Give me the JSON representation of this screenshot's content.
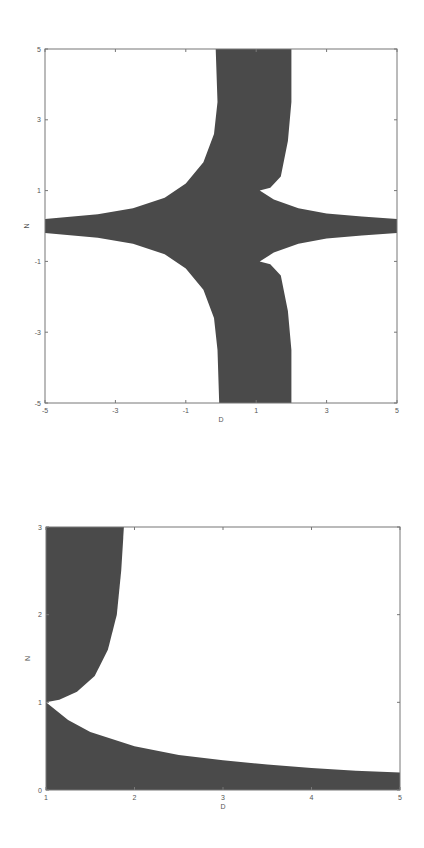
{
  "colors": {
    "fill": "#4a4a4a",
    "frame": "#777777",
    "background": "#ffffff"
  },
  "chart_data": [
    {
      "type": "area",
      "title": "",
      "xlabel": "D",
      "ylabel": "N",
      "xlim": [
        -5,
        5
      ],
      "ylim": [
        -5,
        5
      ],
      "xticks": [
        -5,
        -3,
        -1,
        1,
        3,
        5
      ],
      "yticks": [
        -5,
        -3,
        -1,
        1,
        3,
        5
      ],
      "grid": false,
      "frame_px": {
        "left": 45,
        "top": 49,
        "right": 397,
        "bottom": 403
      },
      "description": "Shaded region: horizontal band around N=0 widening toward D≈1, and vertical band D≈0..2 for |N|>1, with cusps at (1, ±1)",
      "regions": [
        {
          "name": "upper-vertical-band",
          "points": [
            [
              -0.15,
              5
            ],
            [
              -0.1,
              3.5
            ],
            [
              -0.2,
              2.6
            ],
            [
              -0.5,
              1.8
            ],
            [
              -1.0,
              1.2
            ],
            [
              -1.6,
              0.8
            ],
            [
              -2.5,
              0.5
            ],
            [
              -3.5,
              0.33
            ],
            [
              -5,
              0.2
            ],
            [
              -5,
              -0.2
            ],
            [
              -3.5,
              -0.33
            ],
            [
              -2.5,
              -0.5
            ],
            [
              -1.6,
              -0.8
            ],
            [
              -1.0,
              -1.2
            ],
            [
              -0.5,
              -1.8
            ],
            [
              -0.2,
              -2.6
            ],
            [
              -0.1,
              -3.5
            ],
            [
              -0.05,
              -5
            ],
            [
              2.0,
              -5
            ],
            [
              2.0,
              -3.5
            ],
            [
              1.9,
              -2.4
            ],
            [
              1.7,
              -1.4
            ],
            [
              1.4,
              -1.08
            ],
            [
              1.1,
              -1.0
            ],
            [
              1.5,
              -0.75
            ],
            [
              2.2,
              -0.5
            ],
            [
              3.0,
              -0.35
            ],
            [
              4.0,
              -0.27
            ],
            [
              5,
              -0.2
            ],
            [
              5,
              0.2
            ],
            [
              4.0,
              0.27
            ],
            [
              3.0,
              0.35
            ],
            [
              2.2,
              0.5
            ],
            [
              1.5,
              0.75
            ],
            [
              1.1,
              1.0
            ],
            [
              1.4,
              1.08
            ],
            [
              1.7,
              1.4
            ],
            [
              1.9,
              2.4
            ],
            [
              2.0,
              3.5
            ],
            [
              2.0,
              5
            ]
          ]
        }
      ]
    },
    {
      "type": "area",
      "title": "",
      "xlabel": "D",
      "ylabel": "N",
      "xlim": [
        1,
        5
      ],
      "ylim": [
        0,
        3
      ],
      "xticks": [
        1,
        2,
        3,
        4,
        5
      ],
      "yticks": [
        0,
        1,
        2,
        3
      ],
      "grid": false,
      "frame_px": {
        "left": 46,
        "top": 527,
        "right": 400,
        "bottom": 790
      },
      "description": "Shaded region below curve N≈1/D and region above curve from (1,1) to (1.88,3)",
      "regions": [
        {
          "name": "upper-left-region",
          "points": [
            [
              1,
              3
            ],
            [
              1.88,
              3
            ],
            [
              1.85,
              2.5
            ],
            [
              1.8,
              2.0
            ],
            [
              1.7,
              1.6
            ],
            [
              1.55,
              1.3
            ],
            [
              1.35,
              1.12
            ],
            [
              1.15,
              1.03
            ],
            [
              1,
              1
            ]
          ]
        },
        {
          "name": "lower-region",
          "points": [
            [
              1,
              1
            ],
            [
              1.25,
              0.8
            ],
            [
              1.5,
              0.66
            ],
            [
              2,
              0.5
            ],
            [
              2.5,
              0.4
            ],
            [
              3,
              0.34
            ],
            [
              3.5,
              0.29
            ],
            [
              4,
              0.25
            ],
            [
              4.5,
              0.22
            ],
            [
              5,
              0.2
            ],
            [
              5,
              0
            ],
            [
              1,
              0
            ]
          ]
        }
      ]
    }
  ]
}
